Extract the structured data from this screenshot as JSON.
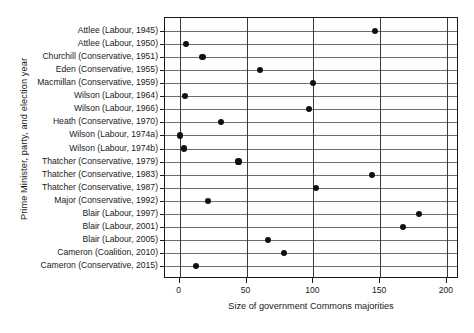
{
  "chart_data": {
    "type": "scatter",
    "title": "",
    "xlabel": "Size of government Commons majorities",
    "ylabel": "Prime Minister, party, and election year",
    "xlim": [
      -11,
      209
    ],
    "xticks": [
      0,
      50,
      100,
      150,
      200
    ],
    "xtick_labels": [
      "0",
      "50",
      "100",
      "150",
      "200"
    ],
    "grid": "vertical gridlines at each x tick, horizontal rule per category row",
    "legend": "none",
    "orientation": "horizontal dot plot",
    "categories": [
      "Attlee (Labour, 1945)",
      "Attlee (Labour, 1950)",
      "Churchill (Conservative, 1951)",
      "Eden (Conservative, 1955)",
      "Macmillan (Conservative, 1959)",
      "Wilson (Labour, 1964)",
      "Wilson (Labour, 1966)",
      "Heath (Conservative, 1970)",
      "Wilson (Labour, 1974a)",
      "Wilson (Labour, 1974b)",
      "Thatcher (Conservative, 1979)",
      "Thatcher (Conservative, 1983)",
      "Thatcher (Conservative, 1987)",
      "Major (Conservative, 1992)",
      "Blair (Labour, 1997)",
      "Blair (Labour, 2001)",
      "Blair (Labour, 2005)",
      "Cameron (Coalition, 2010)",
      "Cameron (Conservative, 2015)"
    ],
    "values": [
      146,
      5,
      17,
      60,
      100,
      4,
      97,
      31,
      0,
      3,
      44,
      144,
      102,
      21,
      179,
      167,
      66,
      78,
      12
    ]
  }
}
